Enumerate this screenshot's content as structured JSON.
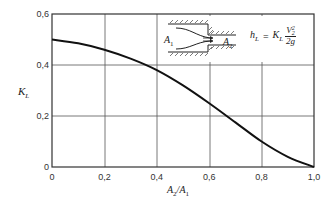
{
  "chart_data": {
    "type": "line",
    "title": "",
    "xlabel": "A2/A1",
    "ylabel": "KL",
    "xlim": [
      0,
      1.0
    ],
    "ylim": [
      0,
      0.6
    ],
    "grid": true,
    "x_ticks": [
      "0",
      "0,2",
      "0,4",
      "0,6",
      "0,8",
      "1,0"
    ],
    "y_ticks": [
      "0",
      "0,2",
      "0,4",
      "0,6"
    ],
    "series": [
      {
        "name": "KL",
        "x": [
          0,
          0.1,
          0.2,
          0.3,
          0.4,
          0.5,
          0.6,
          0.7,
          0.8,
          0.9,
          1.0
        ],
        "y": [
          0.5,
          0.485,
          0.46,
          0.425,
          0.38,
          0.32,
          0.25,
          0.175,
          0.1,
          0.04,
          0.0
        ]
      }
    ],
    "annotations": [
      {
        "text": "A1",
        "role": "inlet-area-label"
      },
      {
        "text": "A2",
        "role": "outlet-area-label"
      },
      {
        "text": "hL = KL V2^2 / 2g",
        "role": "formula"
      }
    ]
  },
  "axis": {
    "xlabel_main": "A",
    "xlabel_sub1": "2",
    "xlabel_slash": "/A",
    "xlabel_sub2": "1",
    "ylabel_main": "K",
    "ylabel_sub": "L"
  },
  "inset": {
    "inlet_label": "A",
    "inlet_sub": "1",
    "outlet_label": "A",
    "outlet_sub": "2",
    "formula_lhs": "h",
    "formula_lhs_sub": "L",
    "formula_eq": "=",
    "formula_k": "K",
    "formula_k_sub": "L",
    "formula_num": "V",
    "formula_num_sup": "2",
    "formula_num_sub": "2",
    "formula_den": "2g"
  }
}
